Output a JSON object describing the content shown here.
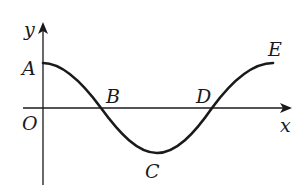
{
  "diagram": {
    "type": "cosine-curve-on-axes",
    "colors": {
      "stroke": "#1a1a1a",
      "background": "#ffffff"
    },
    "axes": {
      "x_label": "x",
      "y_label": "y",
      "origin_label": "O"
    },
    "points": [
      {
        "id": "A",
        "label": "A",
        "description": "curve start on y-axis (maximum)"
      },
      {
        "id": "B",
        "label": "B",
        "description": "first x-axis crossing"
      },
      {
        "id": "C",
        "label": "C",
        "description": "minimum below x-axis"
      },
      {
        "id": "D",
        "label": "D",
        "description": "second x-axis crossing"
      },
      {
        "id": "E",
        "label": "E",
        "description": "curve end (maximum)"
      }
    ]
  }
}
